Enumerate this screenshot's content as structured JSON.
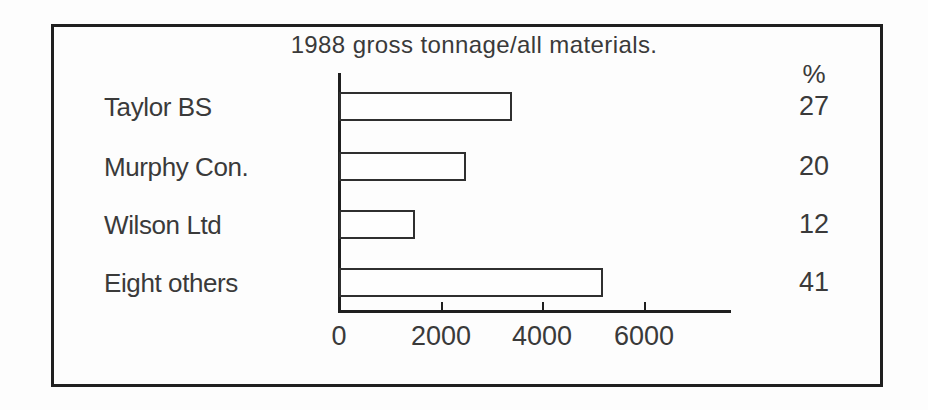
{
  "chart_data": {
    "type": "bar",
    "orientation": "horizontal",
    "title": "1988 gross tonnage/all materials.",
    "percent_header": "%",
    "categories": [
      "Taylor BS",
      "Murphy Con.",
      "Wilson Ltd",
      "Eight others"
    ],
    "values": [
      3400,
      2500,
      1500,
      5200
    ],
    "percent_labels": [
      27,
      20,
      12,
      41
    ],
    "x_ticks": [
      0,
      2000,
      4000,
      6000
    ],
    "xlabel": "",
    "ylabel": "",
    "xlim": [
      0,
      7700
    ],
    "grid": false,
    "legend": false,
    "bar_fill": "#fefefe",
    "bar_outline": "#2f2f2f"
  },
  "colors": {
    "background": "#fdfdfd",
    "frame_border": "#1f1f1f",
    "axis": "#1f1f1f",
    "text": "#3a3a3a"
  }
}
